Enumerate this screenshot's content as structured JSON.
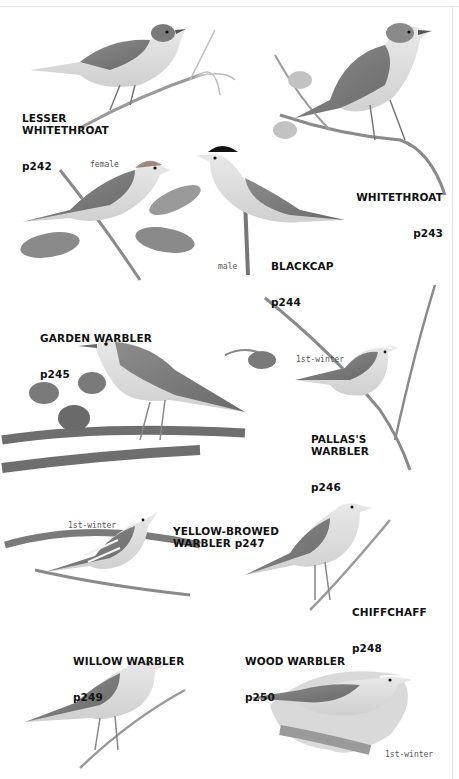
{
  "plate": {
    "species": [
      {
        "name": "LESSER\nWHITETHROAT",
        "page": "p242"
      },
      {
        "name": "WHITETHROAT",
        "page": "p243"
      },
      {
        "name": "BLACKCAP",
        "page": "p244",
        "notes": [
          "female",
          "male"
        ]
      },
      {
        "name": "GARDEN WARBLER",
        "page": "p245"
      },
      {
        "name": "PALLAS'S\nWARBLER",
        "page": "p246",
        "notes": [
          "1st-winter"
        ]
      },
      {
        "name": "YELLOW-BROWED\nWARBLER p247",
        "page": "",
        "notes": [
          "1st-winter"
        ]
      },
      {
        "name": "CHIFFCHAFF",
        "page": "p248"
      },
      {
        "name": "WILLOW WARBLER",
        "page": "p249"
      },
      {
        "name": "WOOD WARBLER",
        "page": "p250",
        "notes": [
          "1st-winter"
        ]
      }
    ]
  },
  "colors": {
    "ink": "#111111",
    "note": "#555555",
    "bird_dark": "#6e6e6e",
    "bird_mid": "#9a9a9a",
    "bird_light": "#d6d6d6",
    "branch": "#7a7a7a"
  }
}
